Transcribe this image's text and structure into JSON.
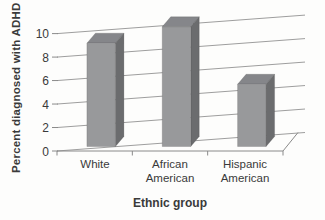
{
  "chart_data": {
    "type": "bar",
    "projection": "3d-column",
    "title": "",
    "xlabel": "Ethnic group",
    "ylabel": "Percent diagnosed with ADHD",
    "categories": [
      "White",
      "African American",
      "Hispanic American"
    ],
    "values": [
      8.8,
      10.2,
      5.3
    ],
    "ylim": [
      0,
      10
    ],
    "yticks": [
      "0",
      "2",
      "4",
      "6",
      "8",
      "10"
    ],
    "grid": true,
    "legend": false
  },
  "colors": {
    "bar_front": "#98999b",
    "bar_top": "#85868a",
    "bar_side": "#6b6c6e",
    "bar_edge": "rgba(70,70,72,0.35)",
    "gridline": "#9e9e9e",
    "axis": "#8a8a8a",
    "text": "#3a3a3a",
    "background": "#fdfdfc"
  }
}
